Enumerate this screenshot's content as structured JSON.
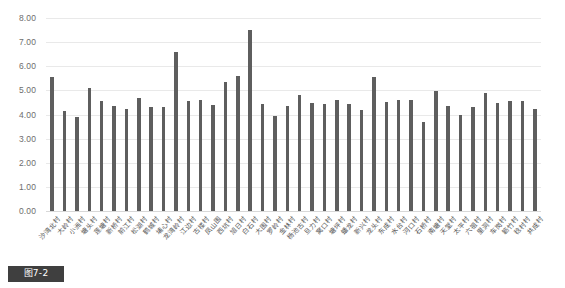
{
  "figure": {
    "caption_label": "图7-2"
  },
  "chart_data": {
    "type": "bar",
    "title": "",
    "subtitle": "",
    "xlabel": "",
    "ylabel": "",
    "ylim": [
      0,
      8
    ],
    "ytick_step": 1,
    "grid": true,
    "legend": "none",
    "bar_color": "#5e5e5e",
    "gridline_color": "#e9e9e9",
    "ytick_labels": [
      "8.00",
      "7.00",
      "6.00",
      "5.00",
      "4.00",
      "3.00",
      "2.00",
      "1.00",
      "0.00"
    ],
    "categories": [
      "沙湾北村",
      "大岭村",
      "小洲村",
      "塘头村",
      "莲塘村",
      "新桥村",
      "前江村",
      "松湖村",
      "鹤城村",
      "埔心村",
      "龙湾岭村",
      "江边村",
      "古楼村",
      "凤山围",
      "西坑村",
      "旭日村",
      "白石村",
      "大围村",
      "罗岭村",
      "金林村",
      "杨池古村",
      "旦力村",
      "窝口村",
      "塘坪村",
      "蟠龙村",
      "新兴村",
      "龙头村",
      "东成村",
      "水台村",
      "河口村",
      "石桥村",
      "南塘村",
      "天堂村",
      "太平村",
      "六祖村",
      "里洞村",
      "车岗村",
      "簕竹村",
      "稔村村",
      "共成村"
    ],
    "values": [
      5.55,
      4.15,
      3.88,
      5.08,
      4.58,
      4.35,
      4.22,
      4.68,
      4.33,
      4.33,
      6.58,
      4.55,
      4.62,
      4.38,
      5.35,
      5.58,
      7.52,
      4.43,
      3.95,
      4.35,
      4.82,
      4.48,
      4.45,
      4.62,
      4.42,
      4.18,
      5.55,
      4.52,
      4.6,
      4.62,
      3.68,
      4.98,
      4.35,
      3.98,
      4.33,
      4.9,
      4.48,
      4.55,
      4.58,
      4.22
    ]
  }
}
